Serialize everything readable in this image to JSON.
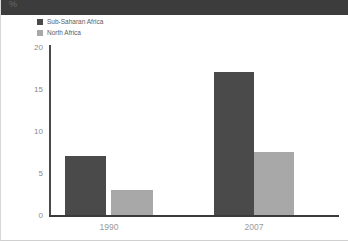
{
  "unit_label": "%",
  "legend": {
    "position": "top-left",
    "entries": [
      {
        "label": "Sub-Saharan Africa",
        "color": "#4a4a4a"
      },
      {
        "label": "North Africa",
        "color": "#a8a8a8"
      }
    ]
  },
  "axis": {
    "y_ticks": [
      "20",
      "15",
      "10",
      "5",
      "0"
    ],
    "x_ticks": [
      "1990",
      "2007"
    ]
  },
  "chart_data": {
    "type": "bar",
    "title": "",
    "subtitle": "",
    "xlabel": "",
    "ylabel": "%",
    "categories": [
      "1990",
      "2007"
    ],
    "series": [
      {
        "name": "Sub-Saharan Africa",
        "color": "#4a4a4a",
        "values": [
          7,
          17
        ]
      },
      {
        "name": "North Africa",
        "color": "#a8a8a8",
        "values": [
          3,
          7.5
        ]
      }
    ],
    "ylim": [
      0,
      20
    ],
    "ytick_values": [
      0,
      5,
      10,
      15,
      20
    ],
    "grid": false,
    "legend_position": "top-left"
  }
}
